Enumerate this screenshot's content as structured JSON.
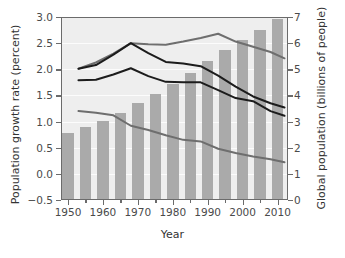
{
  "chart_data": {
    "type": "bar",
    "title": "",
    "subtitle": "",
    "xlabel": "Year",
    "ylabel": "Population growth rate (percent)",
    "y2label": "Global population (billions of people)",
    "xlim": [
      1948,
      2013
    ],
    "ylim": [
      -0.5,
      3.0
    ],
    "y2lim": [
      0,
      7
    ],
    "yticks": [
      -0.5,
      0.0,
      0.5,
      1.0,
      1.5,
      2.0,
      2.5,
      3.0
    ],
    "ytick_labels": [
      "−0.5",
      "0.0",
      "0.5",
      "1.0",
      "1.5",
      "2.0",
      "2.5",
      "3.0"
    ],
    "y2ticks": [
      0,
      1,
      2,
      3,
      4,
      5,
      6,
      7
    ],
    "y2tick_labels": [
      "0",
      "1",
      "2",
      "3",
      "4",
      "5",
      "6",
      "7"
    ],
    "xticks": [
      1950,
      1960,
      1970,
      1980,
      1990,
      2000,
      2010
    ],
    "xtick_labels": [
      "1950",
      "1960",
      "1970",
      "1980",
      "1990",
      "2000",
      "2010"
    ],
    "xticks_minor": [
      1955,
      1965,
      1975,
      1985,
      1995,
      2005
    ],
    "grid": "horizontal-white",
    "legend": "none",
    "plot_bg": "#eeeeee",
    "bar_color": "#aaaaaa",
    "series": [
      {
        "name": "Global population",
        "kind": "bar",
        "axis": "right",
        "units": "billions of people",
        "x": [
          1950,
          1955,
          1960,
          1965,
          1970,
          1975,
          1980,
          1985,
          1990,
          1995,
          2000,
          2005,
          2010
        ],
        "values": [
          2.55,
          2.78,
          3.03,
          3.34,
          3.7,
          4.07,
          4.45,
          4.85,
          5.31,
          5.74,
          6.12,
          6.51,
          6.92
        ]
      },
      {
        "name": "Upper growth-rate curve",
        "kind": "line",
        "axis": "left",
        "units": "percent",
        "color": "#6e6e6e",
        "x": [
          1953,
          1958,
          1963,
          1968,
          1973,
          1978,
          1983,
          1988,
          1993,
          1998,
          2003,
          2008,
          2012
        ],
        "values": [
          2.01,
          2.13,
          2.3,
          2.5,
          2.48,
          2.47,
          2.53,
          2.6,
          2.68,
          2.53,
          2.43,
          2.33,
          2.21
        ]
      },
      {
        "name": "Middle growth-rate curve",
        "kind": "line",
        "axis": "left",
        "units": "percent",
        "color": "#1c1c1c",
        "x": [
          1953,
          1958,
          1963,
          1968,
          1973,
          1978,
          1983,
          1988,
          1993,
          1998,
          2003,
          2008,
          2012
        ],
        "values": [
          2.01,
          2.08,
          2.28,
          2.5,
          2.31,
          2.14,
          2.11,
          2.06,
          1.88,
          1.67,
          1.48,
          1.35,
          1.27
        ]
      },
      {
        "name": "Lower growth-rate curve",
        "kind": "line",
        "axis": "left",
        "units": "percent",
        "color": "#1c1c1c",
        "x": [
          1953,
          1958,
          1963,
          1968,
          1973,
          1978,
          1983,
          1988,
          1993,
          1998,
          2003,
          2008,
          2012
        ],
        "values": [
          1.79,
          1.8,
          1.9,
          2.02,
          1.87,
          1.76,
          1.75,
          1.75,
          1.6,
          1.45,
          1.39,
          1.2,
          1.11
        ]
      },
      {
        "name": "Bottom growth-rate curve",
        "kind": "line",
        "axis": "left",
        "units": "percent",
        "color": "#6e6e6e",
        "x": [
          1953,
          1958,
          1963,
          1968,
          1973,
          1978,
          1983,
          1988,
          1993,
          1998,
          2003,
          2008,
          2012
        ],
        "values": [
          1.2,
          1.17,
          1.12,
          0.92,
          0.84,
          0.74,
          0.65,
          0.62,
          0.48,
          0.4,
          0.33,
          0.28,
          0.22
        ]
      }
    ]
  }
}
